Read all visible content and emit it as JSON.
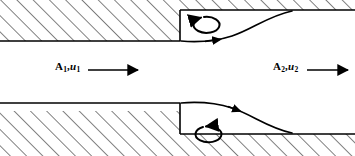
{
  "figure": {
    "name": "sudden-expansion-duct-flow-diagram",
    "width": 355,
    "height": 156,
    "background_color": "#ffffff",
    "line_color": "#000000",
    "hatch_color": "#1a1a1a"
  },
  "labels": {
    "inlet": {
      "area_symbol": "A",
      "area_subscript": "1",
      "separator": ",",
      "velocity_symbol": "u",
      "velocity_subscript": "1",
      "full_text": "A1,u1",
      "arrow_direction": "right"
    },
    "outlet": {
      "area_symbol": "A",
      "area_subscript": "2",
      "separator": ",",
      "velocity_symbol": "u",
      "velocity_subscript": "2",
      "full_text": "A2,u2",
      "arrow_direction": "right"
    }
  },
  "geometry": {
    "step_x": 180,
    "upper_wall_inlet_y": 41,
    "lower_wall_inlet_y": 103,
    "upper_wall_outlet_y": 10,
    "lower_wall_outlet_y": 134,
    "reattachment_x": 292,
    "hatch_angle_deg": 45,
    "hatch_spacing": 11.5
  },
  "annotations": {
    "upper_eddy": "recirculation-vortex-clockwise",
    "lower_eddy": "recirculation-vortex-counterclockwise",
    "upper_streamline": "separating-shear-layer-upper",
    "lower_streamline": "separating-shear-layer-lower"
  }
}
